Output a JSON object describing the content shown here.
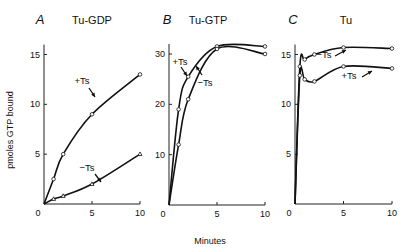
{
  "figure": {
    "ylabel": "pmoles GTP bound",
    "xlabel": "Minutes"
  },
  "chart_data": [
    {
      "type": "line",
      "panel": "A",
      "title": "Tu-GDP",
      "xlabel": "Minutes",
      "ylabel": "pmoles GTP bound",
      "xlim": [
        0,
        10
      ],
      "ylim": [
        0,
        16
      ],
      "xticks": [
        0,
        5,
        10
      ],
      "yticks": [
        5,
        10,
        15
      ],
      "grid": false,
      "series": [
        {
          "name": "+Ts",
          "marker": "circle",
          "x": [
            0,
            1,
            2,
            5,
            10
          ],
          "values": [
            0,
            2.5,
            5,
            9,
            13
          ]
        },
        {
          "name": "-Ts",
          "marker": "triangle",
          "x": [
            0,
            1,
            2,
            5,
            10
          ],
          "values": [
            0,
            0.5,
            0.8,
            2,
            5
          ]
        }
      ]
    },
    {
      "type": "line",
      "panel": "B",
      "title": "Tu-GTP",
      "xlabel": "Minutes",
      "ylabel": "pmoles GTP bound",
      "xlim": [
        0,
        10
      ],
      "ylim": [
        0,
        32
      ],
      "xticks": [
        0,
        5,
        10
      ],
      "yticks": [
        10,
        20,
        30
      ],
      "grid": false,
      "series": [
        {
          "name": "+Ts",
          "marker": "circle",
          "x": [
            0,
            1,
            2,
            5,
            10
          ],
          "values": [
            0,
            19,
            25.5,
            31.5,
            31.5
          ]
        },
        {
          "name": "-Ts",
          "marker": "circle",
          "x": [
            0,
            1,
            2,
            5,
            10
          ],
          "values": [
            0,
            12,
            21,
            31,
            30
          ]
        }
      ]
    },
    {
      "type": "line",
      "panel": "C",
      "title": "Tu",
      "xlabel": "Minutes",
      "ylabel": "pmoles GTP bound",
      "xlim": [
        0,
        10
      ],
      "ylim": [
        0,
        16
      ],
      "xticks": [
        0,
        5,
        10
      ],
      "yticks": [
        5,
        10,
        15
      ],
      "grid": false,
      "series": [
        {
          "name": "-Ts",
          "marker": "circle",
          "x": [
            0,
            0.5,
            1,
            2,
            5,
            10
          ],
          "values": [
            0,
            13.8,
            14.5,
            15,
            15.7,
            15.6
          ]
        },
        {
          "name": "+Ts",
          "marker": "circle",
          "x": [
            0,
            0.5,
            1,
            2,
            5,
            10
          ],
          "values": [
            0,
            12.9,
            12.5,
            12.3,
            13.8,
            13.6
          ]
        }
      ]
    }
  ]
}
